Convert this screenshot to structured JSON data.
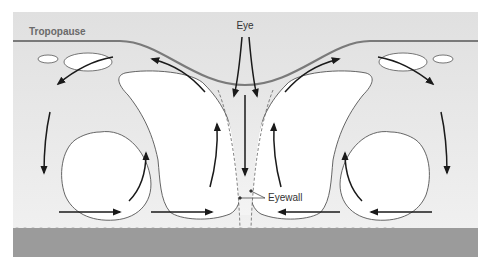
{
  "diagram": {
    "labels": {
      "tropopause": "Tropopause",
      "eye": "Eye",
      "eyewall": "Eyewall"
    },
    "colors": {
      "background": "#ffffff",
      "atmosphere": "#e4e4e4",
      "ocean": "#9b9b9b",
      "tropopause_line": "#7a7a7a",
      "cloud_fill": "#ffffff",
      "cloud_outline": "#555555",
      "arrow": "#1a1a1a",
      "tropopause_label": "#6a6a6a",
      "label_text": "#333333"
    }
  }
}
